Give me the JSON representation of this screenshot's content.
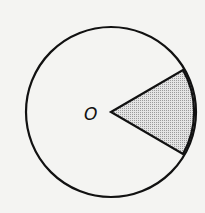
{
  "diagram": {
    "type": "circle-with-shaded-sector",
    "center_label": "O",
    "colors": {
      "background": "#f4f4f2",
      "stroke": "#111111",
      "sector_fill": "#cfcfcf"
    },
    "circle": {
      "cx": 111,
      "cy": 112,
      "r": 85
    },
    "sector": {
      "vertex": [
        111,
        112
      ],
      "start_point": [
        183,
        70
      ],
      "end_point": [
        183,
        154
      ]
    }
  }
}
